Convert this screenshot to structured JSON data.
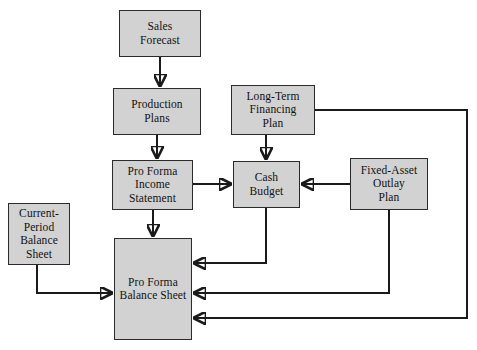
{
  "diagram": {
    "fill_color": "#d2d2d2",
    "border_color": "#2b2b2b",
    "line_color": "#1a1a1a",
    "background": "#ffffff",
    "nodes": [
      {
        "id": "sales_forecast",
        "label": "Sales\nForecast",
        "line1": "Sales",
        "line2": "Forecast",
        "line3": "",
        "line4": "",
        "x": 119,
        "y": 10,
        "w": 82,
        "h": 47
      },
      {
        "id": "production_plans",
        "label": "Production\nPlans",
        "line1": "Production",
        "line2": "Plans",
        "line3": "",
        "line4": "",
        "x": 113,
        "y": 88,
        "w": 88,
        "h": 47
      },
      {
        "id": "long_term_fin",
        "label": "Long-Term\nFinancing\nPlan",
        "line1": "Long-Term",
        "line2": "Financing",
        "line3": "Plan",
        "line4": "",
        "x": 231,
        "y": 85,
        "w": 84,
        "h": 50
      },
      {
        "id": "pro_forma_income",
        "label": "Pro Forma\nIncome\nStatement",
        "line1": "Pro Forma",
        "line2": "Income",
        "line3": "Statement",
        "line4": "",
        "x": 112,
        "y": 160,
        "w": 81,
        "h": 50
      },
      {
        "id": "cash_budget",
        "label": "Cash\nBudget",
        "line1": "Cash",
        "line2": "Budget",
        "line3": "",
        "line4": "",
        "x": 233,
        "y": 161,
        "w": 67,
        "h": 47
      },
      {
        "id": "fixed_asset",
        "label": "Fixed-Asset\nOutlay\nPlan",
        "line1": "Fixed-Asset",
        "line2": "Outlay",
        "line3": "Plan",
        "line4": "",
        "x": 350,
        "y": 158,
        "w": 78,
        "h": 52
      },
      {
        "id": "current_period",
        "label": "Current-\nPeriod\nBalance\nSheet",
        "line1": "Current-",
        "line2": "Period",
        "line3": "Balance",
        "line4": "Sheet",
        "x": 8,
        "y": 203,
        "w": 62,
        "h": 62
      },
      {
        "id": "pro_forma_bs",
        "label": "Pro Forma\nBalance Sheet",
        "line1": "Pro Forma",
        "line2": "Balance Sheet",
        "line3": "",
        "line4": "",
        "x": 114,
        "y": 238,
        "w": 78,
        "h": 102
      }
    ],
    "edges": [
      {
        "id": "sales-to-production",
        "from": "sales_forecast",
        "to": "production_plans"
      },
      {
        "id": "production-to-income",
        "from": "production_plans",
        "to": "pro_forma_income"
      },
      {
        "id": "income-to-cash",
        "from": "pro_forma_income",
        "to": "cash_budget"
      },
      {
        "id": "income-to-balance",
        "from": "pro_forma_income",
        "to": "pro_forma_bs"
      },
      {
        "id": "longterm-to-cash",
        "from": "long_term_fin",
        "to": "cash_budget"
      },
      {
        "id": "longterm-to-balance",
        "from": "long_term_fin",
        "to": "pro_forma_bs"
      },
      {
        "id": "fixedasset-to-cash",
        "from": "fixed_asset",
        "to": "cash_budget"
      },
      {
        "id": "fixedasset-to-balance",
        "from": "fixed_asset",
        "to": "pro_forma_bs"
      },
      {
        "id": "cash-to-balance",
        "from": "cash_budget",
        "to": "pro_forma_bs"
      },
      {
        "id": "currentperiod-to-balance",
        "from": "current_period",
        "to": "pro_forma_bs"
      }
    ]
  }
}
